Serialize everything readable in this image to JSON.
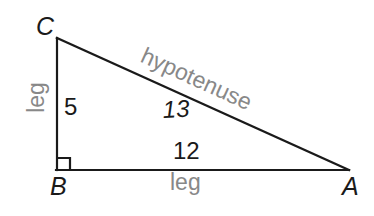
{
  "figure": {
    "background_color": "#ffffff",
    "line_color": "#1a1a1a",
    "measure_color": "#1a1a1a",
    "descriptor_color": "#888888"
  },
  "vertices": {
    "c": {
      "label": "C",
      "x": 57,
      "y": 38
    },
    "b": {
      "label": "B",
      "x": 57,
      "y": 170
    },
    "a": {
      "label": "A",
      "x": 348,
      "y": 170
    }
  },
  "right_angle": {
    "at_vertex": "B",
    "marker_size": 12
  },
  "sides": {
    "vertical_leg": {
      "measure": "5",
      "descriptor": "leg",
      "from": "B",
      "to": "C"
    },
    "horizontal_leg": {
      "measure": "12",
      "descriptor": "leg",
      "from": "B",
      "to": "A"
    },
    "hypotenuse": {
      "measure": "13",
      "descriptor": "hypotenuse",
      "from": "C",
      "to": "A"
    }
  }
}
